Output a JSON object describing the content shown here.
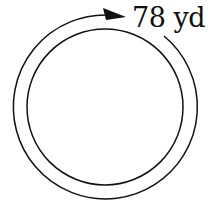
{
  "diagram": {
    "label": "78 yd",
    "shapes": {
      "inner_circle": {
        "cx": 105,
        "cy": 107,
        "r": 78
      },
      "outer_arc": {
        "cx": 105,
        "cy": 107,
        "r": 92,
        "direction": "clockwise",
        "arrow": true
      }
    },
    "colors": {
      "stroke": "#111111",
      "background": "#ffffff"
    }
  }
}
